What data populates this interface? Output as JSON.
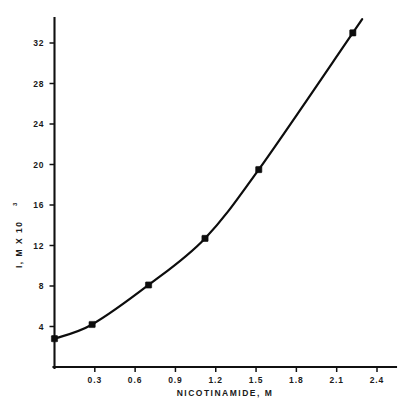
{
  "figure": {
    "background_color": "#ffffff",
    "ink_color": "#0d0d0d"
  },
  "chart_data": {
    "type": "line",
    "title": "",
    "subtitle": "",
    "xlabel": "NICOTINAMIDE, M",
    "ylabel": "I, M X 10",
    "ylabel_exponent": "3",
    "ylabel_full": "I, M X 10^3",
    "xlim": [
      0,
      2.55
    ],
    "ylim": [
      0,
      34.5
    ],
    "xticks": [
      0.3,
      0.6,
      0.9,
      1.2,
      1.5,
      1.8,
      2.1,
      2.4
    ],
    "xtick_labels": [
      "0.3",
      "0.6",
      "0.9",
      "1.2",
      "1.5",
      "1.8",
      "2.1",
      "2.4"
    ],
    "yticks": [
      4,
      8,
      12,
      16,
      20,
      24,
      28,
      32
    ],
    "ytick_labels": [
      "4",
      "8",
      "12",
      "16",
      "20",
      "24",
      "28",
      "32"
    ],
    "grid": false,
    "legend": null,
    "legend_position": "none",
    "marker": "filled-square",
    "series": [
      {
        "name": "I vs nicotinamide",
        "x": [
          0.0,
          0.28,
          0.7,
          1.12,
          1.52,
          2.22
        ],
        "values": [
          2.8,
          4.2,
          8.1,
          12.7,
          19.5,
          33.0
        ]
      }
    ],
    "annotations": []
  },
  "axes": {
    "x_axis_name": "x-axis",
    "y_axis_name": "y-axis"
  }
}
